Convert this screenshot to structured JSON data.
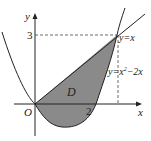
{
  "figure": {
    "axis_labels": {
      "x": "x",
      "y": "y",
      "origin": "O"
    },
    "tick_labels": {
      "x_two": "2",
      "y_three": "3"
    },
    "region_label": "D",
    "curves": [
      {
        "name": "line",
        "equation": "y=x"
      },
      {
        "name": "parabola",
        "equation_prefix": "y=x",
        "equation_exp": "2",
        "equation_suffix": "−2x"
      }
    ],
    "intersection": {
      "x": 3,
      "y": 3
    },
    "colors": {
      "region_fill": "#8a8a8a",
      "stroke": "#222222",
      "dashed": "#444444"
    }
  }
}
